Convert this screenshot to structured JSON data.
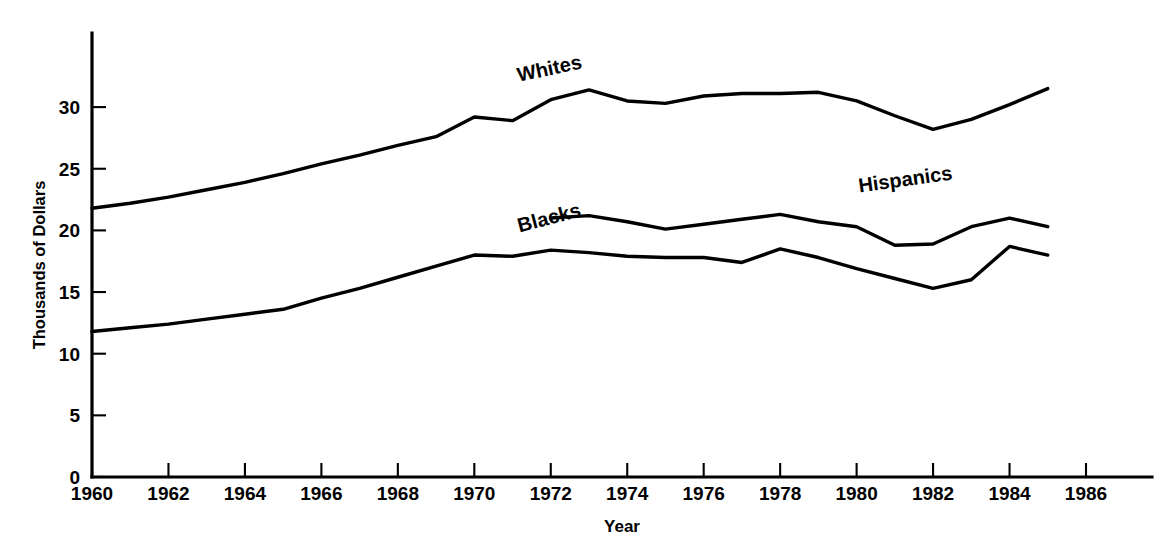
{
  "chart_data": {
    "type": "line",
    "title": "",
    "subtitle": "",
    "xlabel": "Year",
    "ylabel": "Thousands of Dollars",
    "xlim": [
      1960,
      1986.6
    ],
    "ylim": [
      0,
      34
    ],
    "grid": false,
    "legend_position": "inline-labels",
    "xticks": [
      1960,
      1962,
      1964,
      1966,
      1968,
      1970,
      1972,
      1974,
      1976,
      1978,
      1980,
      1982,
      1984,
      1986
    ],
    "xtick_labels": [
      "1960",
      "1962",
      "1964",
      "1966",
      "1968",
      "1970",
      "1972",
      "1974",
      "1976",
      "1978",
      "1980",
      "1982",
      "1984",
      "1986"
    ],
    "yticks": [
      0,
      5,
      10,
      15,
      20,
      25,
      30
    ],
    "ytick_labels": [
      "0",
      "5",
      "10",
      "15",
      "20",
      "25",
      "30"
    ],
    "series": [
      {
        "name": "Whites",
        "label": "Whites",
        "x": [
          1960,
          1961,
          1962,
          1963,
          1964,
          1965,
          1966,
          1967,
          1968,
          1969,
          1970,
          1971,
          1972,
          1973,
          1974,
          1975,
          1976,
          1977,
          1978,
          1979,
          1980,
          1981,
          1982,
          1983,
          1984,
          1985
        ],
        "values": [
          21.8,
          22.2,
          22.7,
          23.3,
          23.9,
          24.6,
          25.4,
          26.1,
          26.9,
          27.6,
          29.2,
          28.9,
          30.6,
          31.4,
          30.5,
          30.3,
          30.9,
          31.1,
          31.1,
          31.2,
          30.5,
          29.3,
          28.2,
          29.0,
          30.2,
          31.5
        ]
      },
      {
        "name": "Blacks",
        "label": "Blacks",
        "x": [
          1960,
          1961,
          1962,
          1963,
          1964,
          1965,
          1966,
          1967,
          1968,
          1969,
          1970,
          1971,
          1972,
          1973,
          1974,
          1975,
          1976,
          1977,
          1978,
          1979,
          1980,
          1981,
          1982,
          1983,
          1984,
          1985
        ],
        "values": [
          11.8,
          12.1,
          12.4,
          12.8,
          13.2,
          13.6,
          14.5,
          15.3,
          16.2,
          17.1,
          18.0,
          17.9,
          18.4,
          18.2,
          17.9,
          17.8,
          17.8,
          17.4,
          18.5,
          17.8,
          16.9,
          16.1,
          15.3,
          16.0,
          18.7,
          18.0
        ]
      },
      {
        "name": "Hispanics",
        "label": "Hispanics",
        "x": [
          1972,
          1973,
          1974,
          1975,
          1976,
          1977,
          1978,
          1979,
          1980,
          1981,
          1982,
          1983,
          1984,
          1985
        ],
        "values": [
          21.0,
          21.2,
          20.7,
          20.1,
          20.5,
          20.9,
          21.3,
          20.7,
          20.3,
          18.8,
          18.9,
          20.3,
          21.0,
          20.3
        ]
      }
    ],
    "series_labels": [
      {
        "text": "Whites",
        "x": 1972.0,
        "y": 32.6,
        "rotation": -12
      },
      {
        "text": "Blacks",
        "x": 1972.0,
        "y": 20.5,
        "rotation": -15
      },
      {
        "text": "Hispanics",
        "x": 1981.3,
        "y": 23.6,
        "rotation": -8
      }
    ],
    "colors": {
      "line": "#000000",
      "axis": "#000000",
      "background": "#ffffff"
    }
  }
}
